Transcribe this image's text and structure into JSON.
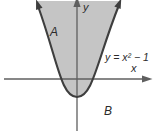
{
  "figure": {
    "equation_label": "y = x² − 1",
    "region_a_label": "A",
    "region_b_label": "B",
    "x_axis_label": "x",
    "y_axis_label": "y"
  },
  "colors": {
    "background": "#ffffff",
    "region_fill": "#c5c5c5",
    "curve_stroke": "#3e3e3e",
    "axis_stroke": "#5f5f5f",
    "text": "#2b2b2b"
  }
}
